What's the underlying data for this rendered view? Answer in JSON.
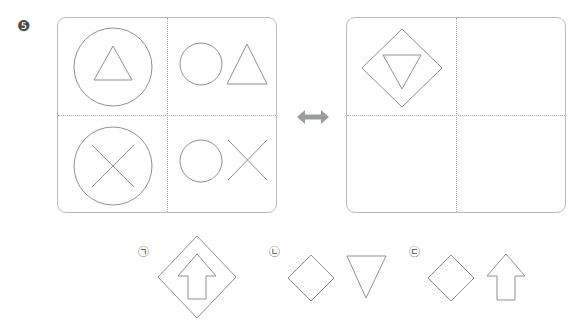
{
  "question": {
    "number_label": "❺",
    "number": 5,
    "type": "shape-transformation-analogy"
  },
  "relation": {
    "operator_icon": "double-headed-horizontal-arrow",
    "operator_label": "↔"
  },
  "panels": [
    {
      "id": "left",
      "name": "source-panel",
      "grid": {
        "rows": 2,
        "cols": 2,
        "divider_style": "dotted"
      },
      "quadrants": [
        {
          "position": "top-left",
          "shapes": [
            {
              "name": "circle",
              "size": "large",
              "role": "outer"
            },
            {
              "name": "triangle-up",
              "size": "medium",
              "role": "inner"
            }
          ],
          "description": "triangle inside circle"
        },
        {
          "position": "top-right",
          "shapes": [
            {
              "name": "circle",
              "size": "small",
              "role": "separate"
            },
            {
              "name": "triangle-up",
              "size": "small",
              "role": "separate"
            }
          ],
          "description": "circle and triangle side by side"
        },
        {
          "position": "bottom-left",
          "shapes": [
            {
              "name": "circle",
              "size": "large",
              "role": "outer"
            },
            {
              "name": "x-mark",
              "size": "medium",
              "role": "inner"
            }
          ],
          "description": "x inside circle"
        },
        {
          "position": "bottom-right",
          "shapes": [
            {
              "name": "circle",
              "size": "small",
              "role": "separate"
            },
            {
              "name": "x-mark",
              "size": "small",
              "role": "separate"
            }
          ],
          "description": "circle and x side by side"
        }
      ]
    },
    {
      "id": "right",
      "name": "target-panel",
      "grid": {
        "rows": 2,
        "cols": 2,
        "divider_style": "dotted"
      },
      "quadrants": [
        {
          "position": "top-left",
          "shapes": [
            {
              "name": "diamond",
              "size": "large",
              "role": "outer"
            },
            {
              "name": "triangle-down",
              "size": "medium",
              "role": "inner"
            }
          ],
          "description": "inverted triangle inside diamond"
        },
        {
          "position": "top-right",
          "shapes": [],
          "description": "empty"
        },
        {
          "position": "bottom-left",
          "shapes": [],
          "description": "empty"
        },
        {
          "position": "bottom-right",
          "shapes": [],
          "description": "empty"
        }
      ]
    }
  ],
  "options": [
    {
      "marker": "㉠",
      "key": "a",
      "shapes": [
        {
          "name": "diamond",
          "size": "large",
          "role": "outer"
        },
        {
          "name": "arrow-up",
          "size": "medium",
          "role": "inner"
        }
      ],
      "description": "up arrow inside diamond"
    },
    {
      "marker": "㉡",
      "key": "b",
      "shapes": [
        {
          "name": "diamond",
          "size": "small",
          "role": "separate"
        },
        {
          "name": "triangle-down",
          "size": "small",
          "role": "separate"
        }
      ],
      "description": "diamond and inverted triangle side by side"
    },
    {
      "marker": "㉢",
      "key": "c",
      "shapes": [
        {
          "name": "diamond",
          "size": "small",
          "role": "separate"
        },
        {
          "name": "arrow-up",
          "size": "small",
          "role": "separate"
        }
      ],
      "description": "diamond and up arrow side by side"
    }
  ],
  "watermark": {
    "text": ""
  },
  "colors": {
    "stroke": "#8d9093",
    "panel_border": "#b9bcbe",
    "divider": "#a9acb0",
    "arrow": "#9a9da0",
    "background": "#ffffff",
    "marker_text": "#4a4a4a"
  }
}
